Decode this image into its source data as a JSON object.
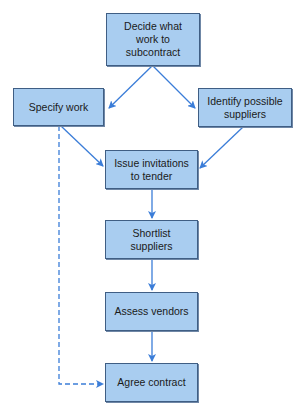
{
  "diagram": {
    "type": "flowchart",
    "colors": {
      "box_fill": "#a9cdf0",
      "box_border": "#3f5e84",
      "arrow": "#3b7dd8"
    },
    "nodes": [
      {
        "id": "decide",
        "label": "Decide what work to subcontract",
        "lines": [
          "Decide what",
          "work to",
          "subcontract"
        ]
      },
      {
        "id": "specify",
        "label": "Specify work"
      },
      {
        "id": "identify",
        "label": "Identify possible suppliers",
        "lines": [
          "Identify possible",
          "suppliers"
        ]
      },
      {
        "id": "issue",
        "label": "Issue invitations to tender",
        "lines": [
          "Issue invitations",
          "to tender"
        ]
      },
      {
        "id": "shortlist",
        "label": "Shortlist suppliers",
        "lines": [
          "Shortlist",
          "suppliers"
        ]
      },
      {
        "id": "assess",
        "label": "Assess vendors"
      },
      {
        "id": "agree",
        "label": "Agree contract"
      }
    ],
    "edges": [
      {
        "from": "decide",
        "to": "specify",
        "style": "solid"
      },
      {
        "from": "decide",
        "to": "identify",
        "style": "solid"
      },
      {
        "from": "specify",
        "to": "issue",
        "style": "solid"
      },
      {
        "from": "identify",
        "to": "issue",
        "style": "solid"
      },
      {
        "from": "issue",
        "to": "shortlist",
        "style": "solid"
      },
      {
        "from": "shortlist",
        "to": "assess",
        "style": "solid"
      },
      {
        "from": "assess",
        "to": "agree",
        "style": "solid"
      },
      {
        "from": "specify",
        "to": "agree",
        "style": "dashed"
      }
    ]
  }
}
